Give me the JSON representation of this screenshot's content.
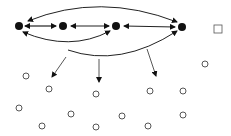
{
  "diagram": {
    "colors": {
      "stroke": "#222222",
      "fill": "#111111",
      "background": "#ffffff"
    },
    "filled_nodes": [
      {
        "id": "n1",
        "x": 19,
        "y": 26
      },
      {
        "id": "n2",
        "x": 63,
        "y": 26
      },
      {
        "id": "n3",
        "x": 116,
        "y": 26
      },
      {
        "id": "n4",
        "x": 182,
        "y": 27
      }
    ],
    "square_node": {
      "x": 218,
      "y": 29,
      "size": 8
    },
    "open_nodes": [
      {
        "x": 205,
        "y": 64
      },
      {
        "x": 26,
        "y": 76
      },
      {
        "x": 49,
        "y": 89
      },
      {
        "x": 96,
        "y": 94
      },
      {
        "x": 150,
        "y": 91
      },
      {
        "x": 183,
        "y": 91
      },
      {
        "x": 19,
        "y": 108
      },
      {
        "x": 71,
        "y": 114
      },
      {
        "x": 122,
        "y": 116
      },
      {
        "x": 183,
        "y": 115
      },
      {
        "x": 42,
        "y": 126
      },
      {
        "x": 96,
        "y": 127
      },
      {
        "x": 148,
        "y": 126
      }
    ]
  }
}
